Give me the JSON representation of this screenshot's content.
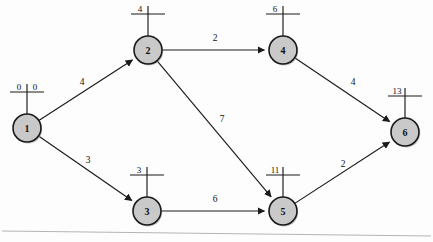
{
  "chart_data": {
    "type": "diagram",
    "title": "",
    "diagram_kind": "directed-weighted-network",
    "nodes": [
      {
        "id": "1",
        "x": 27,
        "y": 128,
        "r": 14,
        "label_left": "0",
        "label_right": "0",
        "marker_style": "split"
      },
      {
        "id": "2",
        "x": 148,
        "y": 50,
        "r": 14,
        "label_left": "4",
        "label_right": "",
        "marker_style": "cross"
      },
      {
        "id": "3",
        "x": 147,
        "y": 211,
        "r": 14,
        "label_left": "3",
        "label_right": "",
        "marker_style": "cross"
      },
      {
        "id": "4",
        "x": 283,
        "y": 50,
        "r": 14,
        "label_left": "6",
        "label_right": "",
        "marker_style": "cross"
      },
      {
        "id": "5",
        "x": 283,
        "y": 211,
        "r": 14,
        "label_left": "11",
        "label_right": "",
        "marker_style": "cross"
      },
      {
        "id": "6",
        "x": 405,
        "y": 132,
        "r": 14,
        "label_left": "13",
        "label_right": "",
        "marker_style": "cross"
      }
    ],
    "edges": [
      {
        "from": "1",
        "to": "2",
        "weight": "4",
        "lx": 82,
        "ly": 85
      },
      {
        "from": "1",
        "to": "3",
        "weight": "3",
        "lx": 88,
        "ly": 163
      },
      {
        "from": "2",
        "to": "4",
        "weight": "2",
        "lx": 215,
        "ly": 41
      },
      {
        "from": "2",
        "to": "5",
        "weight": "7",
        "lx": 222,
        "ly": 122
      },
      {
        "from": "3",
        "to": "5",
        "weight": "6",
        "lx": 215,
        "ly": 202
      },
      {
        "from": "4",
        "to": "6",
        "weight": "4",
        "lx": 353,
        "ly": 85
      },
      {
        "from": "5",
        "to": "6",
        "weight": "2",
        "lx": 343,
        "ly": 167
      }
    ],
    "colors": {
      "node_fill": "#c9c9c9",
      "node_stroke": "#1a1a1a",
      "edge_stroke": "#1a1a1a",
      "text": "#101010",
      "background": "#fdfdfd",
      "page_edge": "#b4b4b4"
    },
    "page_edge_line": {
      "x1": 2,
      "y1": 231,
      "x2": 431,
      "y2": 236
    }
  }
}
